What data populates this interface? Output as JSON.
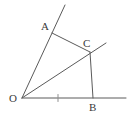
{
  "figure": {
    "type": "plane-geometry-diagram",
    "stroke_color": "#5a5a5a",
    "background_color": "#ffffff",
    "label_color": "#3a3a3a",
    "width": 132,
    "height": 117
  },
  "labels": {
    "O": "O",
    "A": "A",
    "B": "B",
    "C": "C"
  },
  "points": {
    "O": {
      "x": 22,
      "y": 98
    },
    "A": {
      "x": 52,
      "y": 33
    },
    "B": {
      "x": 93,
      "y": 98
    },
    "C": {
      "x": 90,
      "y": 52
    },
    "ray_OA_end": {
      "x": 65,
      "y": 5
    },
    "ray_OB_end": {
      "x": 126,
      "y": 98
    },
    "ray_OC_end": {
      "x": 106,
      "y": 43
    }
  },
  "segments": [
    {
      "name": "ray-OA",
      "from": "O",
      "to": "ray_OA_end"
    },
    {
      "name": "ray-OB",
      "from": "O",
      "to": "ray_OB_end"
    },
    {
      "name": "ray-OC",
      "from": "O",
      "to": "ray_OC_end"
    },
    {
      "name": "segment-AC",
      "from": "A",
      "to": "C"
    },
    {
      "name": "segment-CB",
      "from": "C",
      "to": "B"
    }
  ],
  "tick_marks": [
    {
      "name": "tick-on-OB",
      "x": 58,
      "y": 98,
      "length": 7
    }
  ]
}
